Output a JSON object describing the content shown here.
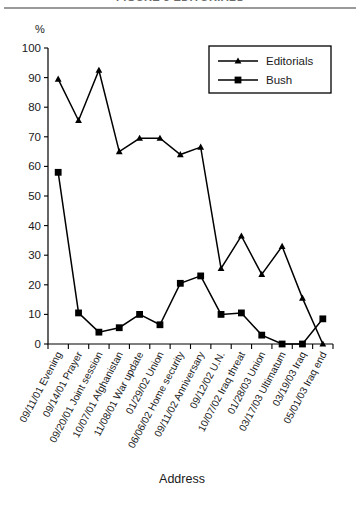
{
  "figure": {
    "title": "FIGURE 3  EDITORIALS",
    "percent_symbol": "%",
    "xlabel": "Address"
  },
  "legend": {
    "entries": [
      {
        "label": "Editorials",
        "marker": "triangle"
      },
      {
        "label": "Bush",
        "marker": "square"
      }
    ]
  },
  "axis": {
    "y_ticks": [
      "100",
      "90",
      "80",
      "70",
      "60",
      "50",
      "40",
      "30",
      "20",
      "10",
      "0"
    ]
  },
  "chart_data": {
    "type": "line",
    "title": "FIGURE 3  EDITORIALS",
    "xlabel": "Address",
    "ylabel": "%",
    "ylim": [
      0,
      100
    ],
    "ytick_step": 10,
    "grid": false,
    "legend_position": "top-right",
    "categories": [
      "09/11/01 Evening",
      "09/14/01 Prayer",
      "09/20/01 Joint session",
      "10/07/01 Afghanistan",
      "11/08/01 War update",
      "01/29/02 Union",
      "06/06/02 Home security",
      "09/11/02 Anniversary",
      "09/12/02 U.N.",
      "10/07/02 Iraq threat",
      "01/28/03 Union",
      "03/17/03 Ultimatum",
      "03/19/03 Iraq",
      "05/01/03 Iraq end"
    ],
    "series": [
      {
        "name": "Editorials",
        "marker": "triangle",
        "values": [
          89.5,
          75.5,
          92.5,
          65.0,
          69.5,
          69.5,
          64.0,
          66.5,
          25.5,
          36.5,
          23.5,
          33.0,
          15.5,
          0.0
        ]
      },
      {
        "name": "Bush",
        "marker": "square",
        "values": [
          58.0,
          10.5,
          4.0,
          5.5,
          10.0,
          6.5,
          20.5,
          23.0,
          10.0,
          10.5,
          3.0,
          0.0,
          0.0,
          8.5
        ]
      }
    ]
  }
}
